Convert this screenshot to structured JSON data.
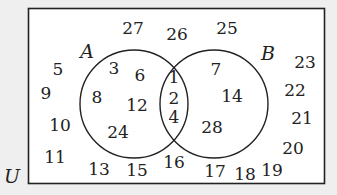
{
  "labels": {
    "universe": "U",
    "set_a": "A",
    "set_b": "B"
  },
  "regions": {
    "a_only": [
      "3",
      "6",
      "8",
      "12",
      "24"
    ],
    "intersection": [
      "1",
      "2",
      "4"
    ],
    "b_only": [
      "7",
      "14",
      "28"
    ],
    "outside": [
      "5",
      "9",
      "10",
      "11",
      "13",
      "15",
      "16",
      "17",
      "18",
      "19",
      "20",
      "21",
      "22",
      "23",
      "25",
      "26",
      "27"
    ]
  },
  "positions": [
    {
      "t": "27",
      "x": 133,
      "y": 28
    },
    {
      "t": "26",
      "x": 177,
      "y": 34
    },
    {
      "t": "25",
      "x": 227,
      "y": 28
    },
    {
      "t": "5",
      "x": 58,
      "y": 69
    },
    {
      "t": "9",
      "x": 46,
      "y": 93
    },
    {
      "t": "10",
      "x": 60,
      "y": 125
    },
    {
      "t": "11",
      "x": 55,
      "y": 157
    },
    {
      "t": "13",
      "x": 99,
      "y": 169
    },
    {
      "t": "15",
      "x": 137,
      "y": 170
    },
    {
      "t": "16",
      "x": 174,
      "y": 162
    },
    {
      "t": "17",
      "x": 215,
      "y": 171
    },
    {
      "t": "18",
      "x": 245,
      "y": 174
    },
    {
      "t": "19",
      "x": 272,
      "y": 170
    },
    {
      "t": "20",
      "x": 293,
      "y": 148
    },
    {
      "t": "21",
      "x": 302,
      "y": 118
    },
    {
      "t": "22",
      "x": 295,
      "y": 90
    },
    {
      "t": "23",
      "x": 305,
      "y": 62
    },
    {
      "t": "3",
      "x": 114,
      "y": 68
    },
    {
      "t": "6",
      "x": 140,
      "y": 75
    },
    {
      "t": "8",
      "x": 97,
      "y": 97
    },
    {
      "t": "12",
      "x": 137,
      "y": 105
    },
    {
      "t": "24",
      "x": 118,
      "y": 132
    },
    {
      "t": "1",
      "x": 174,
      "y": 77
    },
    {
      "t": "2",
      "x": 174,
      "y": 98
    },
    {
      "t": "4",
      "x": 174,
      "y": 117
    },
    {
      "t": "7",
      "x": 216,
      "y": 69
    },
    {
      "t": "14",
      "x": 232,
      "y": 96
    },
    {
      "t": "28",
      "x": 212,
      "y": 127
    }
  ]
}
